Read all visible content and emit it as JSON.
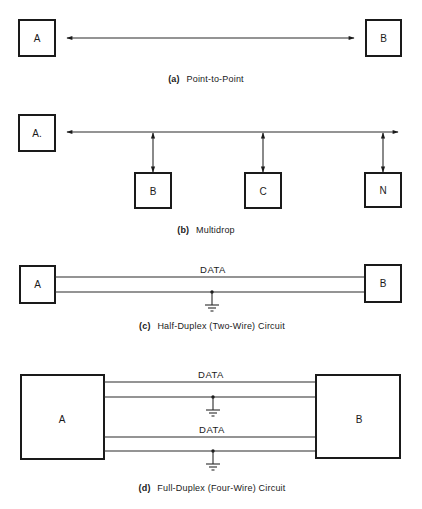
{
  "figure": {
    "panels": [
      {
        "id": "a",
        "tag": "(a)",
        "caption": "Point-to-Point",
        "nodes": [
          "A",
          "B"
        ]
      },
      {
        "id": "b",
        "tag": "(b)",
        "caption": "Multidrop",
        "nodes": [
          "A.",
          "B",
          "C",
          "N"
        ]
      },
      {
        "id": "c",
        "tag": "(c)",
        "caption": "Half-Duplex (Two-Wire) Circuit",
        "nodes": [
          "A",
          "B"
        ],
        "wire_labels": [
          "DATA"
        ]
      },
      {
        "id": "d",
        "tag": "(d)",
        "caption": "Full-Duplex (Four-Wire) Circuit",
        "nodes": [
          "A",
          "B"
        ],
        "wire_labels": [
          "DATA",
          "DATA"
        ]
      }
    ]
  },
  "colors": {
    "ink": "#1a1a1a",
    "background": "#ffffff"
  }
}
